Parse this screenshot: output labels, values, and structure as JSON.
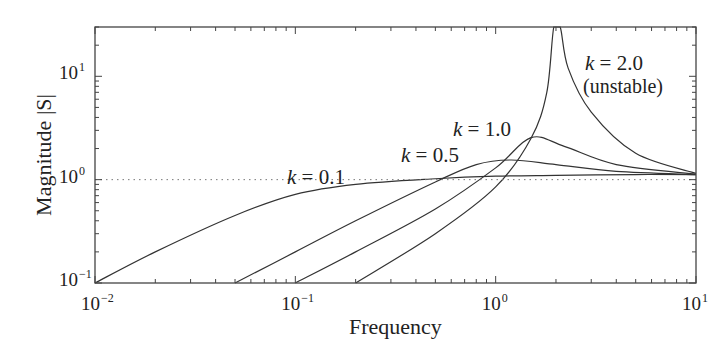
{
  "chart_data": {
    "type": "line",
    "title": "",
    "xlabel": "Frequency",
    "ylabel": "Magnitude |S|",
    "xscale": "log",
    "yscale": "log",
    "xlim": [
      0.01,
      10
    ],
    "ylim": [
      0.1,
      30
    ],
    "grid": false,
    "legend": "none (inline annotations)",
    "x_ticks": [
      {
        "base": "10",
        "exp": "−2",
        "value": 0.01
      },
      {
        "base": "10",
        "exp": "−1",
        "value": 0.1
      },
      {
        "base": "10",
        "exp": "0",
        "value": 1
      },
      {
        "base": "10",
        "exp": "1",
        "value": 10
      }
    ],
    "y_ticks": [
      {
        "base": "10",
        "exp": "−1",
        "value": 0.1
      },
      {
        "base": "10",
        "exp": "0",
        "value": 1
      },
      {
        "base": "10",
        "exp": "1",
        "value": 10
      }
    ],
    "reference_line": {
      "y": 1.0,
      "style": "dotted"
    },
    "series": [
      {
        "name": "k = 0.1",
        "k": "0.1",
        "x": [
          0.01,
          0.02,
          0.05,
          0.1,
          0.2,
          0.5,
          1,
          2,
          5,
          10
        ],
        "y": [
          0.1,
          0.2,
          0.45,
          0.72,
          0.9,
          1.02,
          1.08,
          1.1,
          1.12,
          1.12
        ]
      },
      {
        "name": "k = 0.5",
        "k": "0.5",
        "x": [
          0.05,
          0.1,
          0.2,
          0.5,
          0.8,
          1.2,
          2,
          4,
          10
        ],
        "y": [
          0.1,
          0.2,
          0.4,
          0.95,
          1.4,
          1.55,
          1.4,
          1.2,
          1.12
        ]
      },
      {
        "name": "k = 1.0",
        "k": "1.0",
        "x": [
          0.1,
          0.2,
          0.5,
          1,
          1.5,
          2.2,
          4,
          10
        ],
        "y": [
          0.1,
          0.2,
          0.52,
          1.3,
          2.55,
          2.1,
          1.4,
          1.13
        ]
      },
      {
        "name": "k = 2.0 (unstable)",
        "k": "2.0",
        "x": [
          0.2,
          0.5,
          1,
          1.5,
          1.8,
          1.95,
          2.1,
          2.3,
          3,
          5,
          10
        ],
        "y": [
          0.1,
          0.3,
          0.85,
          2.5,
          7,
          30,
          30,
          12,
          4.5,
          1.8,
          1.15
        ]
      }
    ],
    "annotations": [
      {
        "var": "k",
        "text": " = 0.1",
        "near_series": "k = 0.1"
      },
      {
        "var": "k",
        "text": " = 0.5",
        "near_series": "k = 0.5"
      },
      {
        "var": "k",
        "text": " = 1.0",
        "near_series": "k = 1.0"
      },
      {
        "var": "k",
        "text": " = 2.0",
        "near_series": "k = 2.0 (unstable)"
      },
      {
        "text": "(unstable)",
        "near_series": "k = 2.0 (unstable)"
      }
    ]
  },
  "colors": {
    "line": "#333333",
    "frame": "#444444",
    "reference": "#777777"
  }
}
